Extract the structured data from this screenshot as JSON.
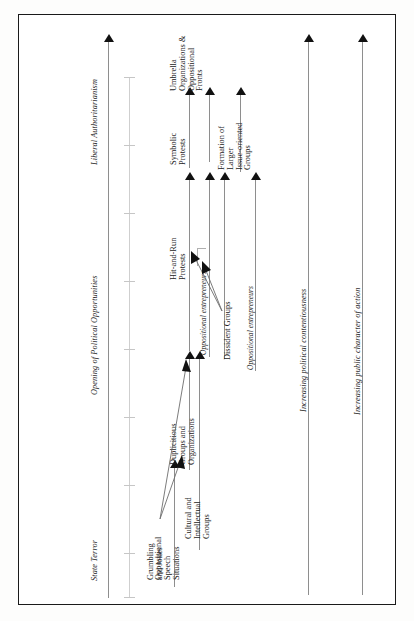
{
  "figure": {
    "orientation": "rotated-90-ccw",
    "background_color": "#ffffff",
    "frame_color": "#1a1a1a",
    "arrow_color": "#111111",
    "shaft_color": "#8e8e8e"
  },
  "axis": {
    "start_label": "State Terror",
    "end_label": "Liberal Authoritarianism",
    "middle_label": "Opening of Political Opportunities"
  },
  "dimension_axes": [
    {
      "label": "Increasing political contentiousness"
    },
    {
      "label": "Increasing public character of action"
    }
  ],
  "actors": [
    {
      "label": "Oppositional entrepreneurs"
    },
    {
      "label": "Oppositional entrepreneurs"
    }
  ],
  "stages": [
    {
      "id": "grumbling",
      "lines": [
        "Grumbling",
        "and Jokes"
      ]
    },
    {
      "id": "oppositional-speech",
      "lines": [
        "Oppositional",
        "Speech",
        "Situations"
      ]
    },
    {
      "id": "duplicitious-groups",
      "lines": [
        "Duplicitious",
        "Groups and",
        "Organizations"
      ]
    },
    {
      "id": "cultural-intellectual",
      "lines": [
        "Cultural and",
        "Intellectual",
        "Groups"
      ]
    },
    {
      "id": "hit-and-run",
      "lines": [
        "Hit-and-Run",
        "Protests"
      ]
    },
    {
      "id": "dissident-groups",
      "lines": [
        "Dissident Groups"
      ]
    },
    {
      "id": "symbolic-protests",
      "lines": [
        "Symbolic",
        "Protests"
      ]
    },
    {
      "id": "formation-larger",
      "lines": [
        "Formation of",
        "Larger",
        "Issue-oriented",
        "Groups"
      ]
    },
    {
      "id": "umbrella-organizations",
      "lines": [
        "Umbrella",
        "Organizations &",
        "Oppositional",
        "Fronts"
      ]
    }
  ]
}
